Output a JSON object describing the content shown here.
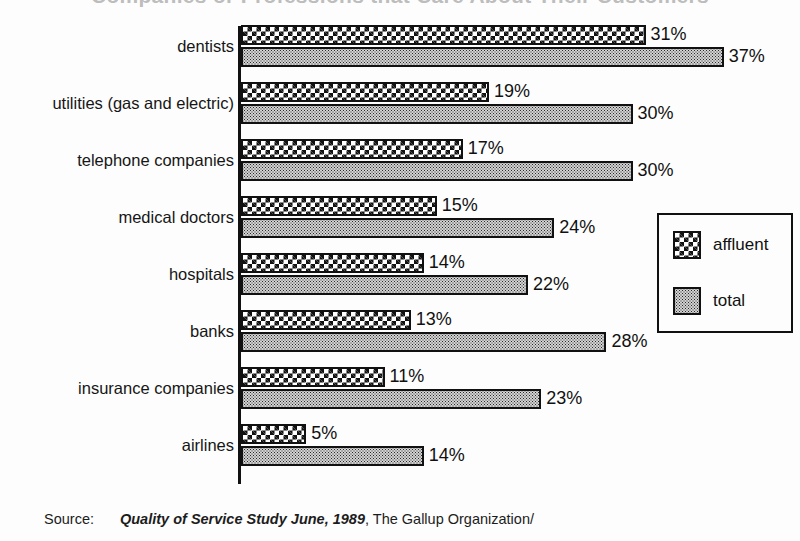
{
  "chart_data": {
    "type": "bar",
    "orientation": "horizontal",
    "title": "Companies or Professions that Care About Their Customers",
    "xlabel": "",
    "ylabel": "",
    "xlim": [
      0,
      40
    ],
    "grid": false,
    "legend_position": "center-right",
    "value_suffix": "%",
    "categories": [
      "dentists",
      "utilities (gas and electric)",
      "telephone companies",
      "medical doctors",
      "hospitals",
      "banks",
      "insurance companies",
      "airlines"
    ],
    "series": [
      {
        "name": "affluent",
        "values": [
          31,
          19,
          17,
          15,
          14,
          13,
          11,
          5
        ],
        "labels": [
          "31%",
          "19%",
          "17%",
          "15%",
          "14%",
          "13%",
          "11%",
          "5%"
        ],
        "fill": "coarse-checkerboard"
      },
      {
        "name": "total",
        "values": [
          37,
          30,
          30,
          24,
          22,
          28,
          23,
          14
        ],
        "labels": [
          "37%",
          "30%",
          "30%",
          "24%",
          "22%",
          "28%",
          "23%",
          "14%"
        ],
        "fill": "fine-dither"
      }
    ]
  },
  "legend": {
    "entries": [
      {
        "label": "affluent"
      },
      {
        "label": "total"
      }
    ]
  },
  "source": {
    "label": "Source:",
    "publication": "Quality of Service Study June, 1989",
    "rest": ", The Gallup Organization/"
  },
  "colors": {
    "ink": "#111111",
    "background": "#fdfdfd",
    "total_fill": "#d2d2d2"
  }
}
